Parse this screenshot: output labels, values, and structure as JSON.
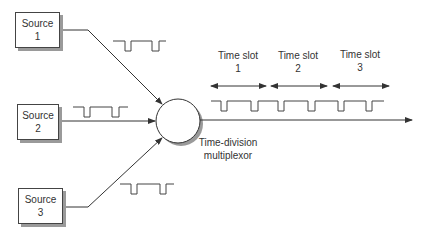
{
  "sources": [
    {
      "name": "Source",
      "number": "1"
    },
    {
      "name": "Source",
      "number": "2"
    },
    {
      "name": "Source",
      "number": "3"
    }
  ],
  "multiplexor": {
    "line1": "Time-division",
    "line2": "multiplexor"
  },
  "time_slots": [
    {
      "label": "Time slot",
      "number": "1"
    },
    {
      "label": "Time slot",
      "number": "2"
    },
    {
      "label": "Time slot",
      "number": "3"
    }
  ],
  "colors": {
    "stroke": "#333333",
    "shadow": "#9a9a9a",
    "background": "#ffffff"
  }
}
